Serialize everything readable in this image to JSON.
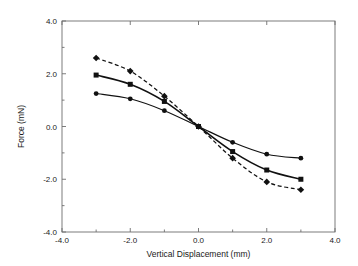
{
  "chart_data": {
    "type": "line",
    "title": "",
    "xlabel": "Vertical Displacement (mm)",
    "ylabel": "Force (mN)",
    "xlim": [
      -4.0,
      4.0
    ],
    "ylim": [
      -4.0,
      4.0
    ],
    "xticks": [
      "-4.0",
      "-2.0",
      "0.0",
      "2.0",
      "4.0"
    ],
    "xtick_values": [
      -4.0,
      -2.0,
      0.0,
      2.0,
      4.0
    ],
    "yticks": [
      "4.0",
      "2.0",
      "0.0",
      "-2.0",
      "-4.0"
    ],
    "ytick_values": [
      4.0,
      2.0,
      0.0,
      -2.0,
      -4.0
    ],
    "grid": false,
    "legend": "none",
    "x": [
      -3.0,
      -2.0,
      -1.0,
      0.0,
      1.0,
      2.0,
      3.0
    ],
    "series": [
      {
        "name": "series-diamond-dashed",
        "marker": "diamond",
        "linestyle": "dashed",
        "color": "#111111",
        "values": [
          2.6,
          2.1,
          1.15,
          0.0,
          -1.2,
          -2.1,
          -2.4
        ]
      },
      {
        "name": "series-square-solid",
        "marker": "square",
        "linestyle": "solid",
        "color": "#111111",
        "values": [
          1.95,
          1.6,
          0.95,
          0.0,
          -0.95,
          -1.65,
          -2.0
        ]
      },
      {
        "name": "series-circle-solid",
        "marker": "circle",
        "linestyle": "solid",
        "color": "#111111",
        "values": [
          1.25,
          1.05,
          0.6,
          0.0,
          -0.6,
          -1.05,
          -1.2
        ]
      }
    ]
  },
  "labels": {
    "xaxis_title": "Vertical Displacement (mm)",
    "yaxis_title": "Force (mN)",
    "xtick_0": "-4.0",
    "xtick_1": "-2.0",
    "xtick_2": "0.0",
    "xtick_3": "2.0",
    "xtick_4": "4.0",
    "ytick_0": "4.0",
    "ytick_1": "2.0",
    "ytick_2": "0.0",
    "ytick_3": "-2.0",
    "ytick_4": "-4.0"
  }
}
